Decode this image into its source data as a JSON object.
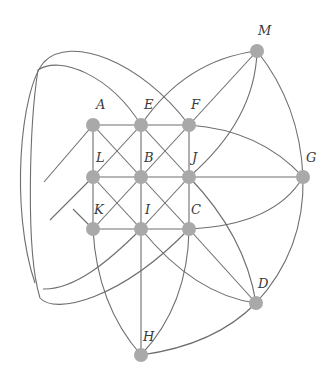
{
  "diagram": {
    "type": "graph",
    "node_color": "#a9a9a9",
    "edge_color": "#6e6e6e",
    "nodes": [
      {
        "id": "A",
        "label": "A",
        "x": 93,
        "y": 125,
        "lx": 96,
        "ly": 98
      },
      {
        "id": "E",
        "label": "E",
        "x": 141,
        "y": 125,
        "lx": 144,
        "ly": 98
      },
      {
        "id": "F",
        "label": "F",
        "x": 189,
        "y": 125,
        "lx": 191,
        "ly": 98
      },
      {
        "id": "L",
        "label": "L",
        "x": 93,
        "y": 177,
        "lx": 96,
        "ly": 151
      },
      {
        "id": "B",
        "label": "B",
        "x": 141,
        "y": 177,
        "lx": 144,
        "ly": 151
      },
      {
        "id": "J",
        "label": "J",
        "x": 189,
        "y": 177,
        "lx": 192,
        "ly": 151
      },
      {
        "id": "G",
        "label": "G",
        "x": 303,
        "y": 177,
        "lx": 306,
        "ly": 151
      },
      {
        "id": "K",
        "label": "K",
        "x": 93,
        "y": 229,
        "lx": 94,
        "ly": 203
      },
      {
        "id": "I",
        "label": "I",
        "x": 141,
        "y": 229,
        "lx": 145,
        "ly": 203
      },
      {
        "id": "C",
        "label": "C",
        "x": 189,
        "y": 229,
        "lx": 191,
        "ly": 203
      },
      {
        "id": "M",
        "label": "M",
        "x": 257,
        "y": 51,
        "lx": 258,
        "ly": 24
      },
      {
        "id": "D",
        "label": "D",
        "x": 256,
        "y": 303,
        "lx": 258,
        "ly": 277
      },
      {
        "id": "H",
        "label": "H",
        "x": 141,
        "y": 355,
        "lx": 143,
        "ly": 330
      }
    ],
    "edges": [
      {
        "from": "A",
        "to": "E",
        "d": "M93,125 L141,125"
      },
      {
        "from": "E",
        "to": "F",
        "d": "M141,125 L189,125"
      },
      {
        "from": "L",
        "to": "B",
        "d": "M93,177 L141,177"
      },
      {
        "from": "B",
        "to": "J",
        "d": "M141,177 L189,177"
      },
      {
        "from": "J",
        "to": "G",
        "d": "M189,177 L303,177"
      },
      {
        "from": "K",
        "to": "I",
        "d": "M93,229 L141,229"
      },
      {
        "from": "I",
        "to": "C",
        "d": "M141,229 L189,229"
      },
      {
        "from": "A",
        "to": "L",
        "d": "M93,125 L93,177"
      },
      {
        "from": "L",
        "to": "K",
        "d": "M93,177 L93,229"
      },
      {
        "from": "E",
        "to": "B",
        "d": "M141,125 L141,177"
      },
      {
        "from": "B",
        "to": "I",
        "d": "M141,177 L141,229"
      },
      {
        "from": "F",
        "to": "J",
        "d": "M189,125 L189,177"
      },
      {
        "from": "J",
        "to": "C",
        "d": "M189,177 L189,229"
      },
      {
        "from": "I",
        "to": "H",
        "d": "M141,229 L141,355"
      },
      {
        "from": "A",
        "to": "C",
        "d": "M93,125 L189,229"
      },
      {
        "from": "E",
        "to": "J",
        "d": "M141,125 L189,177"
      },
      {
        "from": "L",
        "to": "I",
        "d": "M93,177 L141,229"
      },
      {
        "from": "F",
        "to": "K",
        "d": "M189,125 L93,229"
      },
      {
        "from": "E",
        "to": "L",
        "d": "M141,125 L93,177"
      },
      {
        "from": "J",
        "to": "I",
        "d": "M189,177 L141,229"
      },
      {
        "from": "C",
        "to": "D",
        "d": "M189,229 L256,303"
      },
      {
        "from": "M",
        "to": "F",
        "d": "M257,51 L189,125"
      },
      {
        "from": "A",
        "to": "left-ext",
        "d": "M93,125 L44,182"
      },
      {
        "from": "K",
        "to": "left-ext",
        "d": "M93,229 L73,209"
      },
      {
        "from": "L",
        "to": "left-ext",
        "d": "M93,177 L50,220"
      },
      {
        "from": "J",
        "to": "D",
        "d": "M189,177 Q245,235 256,303"
      },
      {
        "from": "I",
        "to": "D",
        "d": "M141,229 Q195,295 256,303"
      },
      {
        "from": "H",
        "to": "D",
        "d": "M141,355 Q215,345 256,303"
      },
      {
        "from": "K",
        "to": "H",
        "d": "M93,229 Q97,305 141,355"
      },
      {
        "from": "C",
        "to": "H",
        "d": "M189,229 Q188,305 141,355"
      },
      {
        "from": "M",
        "to": "E",
        "d": "M257,51 Q185,60 141,125"
      },
      {
        "from": "M",
        "to": "J",
        "d": "M257,51 Q255,120 189,177"
      },
      {
        "from": "M",
        "to": "G",
        "d": "M257,51 Q300,105 303,177"
      },
      {
        "from": "F",
        "to": "G",
        "d": "M189,125 Q260,130 303,177"
      },
      {
        "from": "C",
        "to": "G",
        "d": "M189,229 Q275,225 303,177"
      },
      {
        "from": "G",
        "to": "D",
        "d": "M303,177 Q305,250 256,303"
      },
      {
        "from": "F",
        "to": "I",
        "d": "M189,125 C140,60 70,35 44,62 C20,90 10,210 35,283 M43,289 C75,290 110,260 141,229"
      },
      {
        "from": "E",
        "to": "C",
        "d": "M141,125 C110,75 60,55 38,70 C30,120 25,250 40,298 C55,315 120,300 189,229"
      }
    ],
    "labels": [
      "A",
      "E",
      "F",
      "L",
      "B",
      "J",
      "G",
      "K",
      "I",
      "C",
      "M",
      "D",
      "H"
    ]
  }
}
